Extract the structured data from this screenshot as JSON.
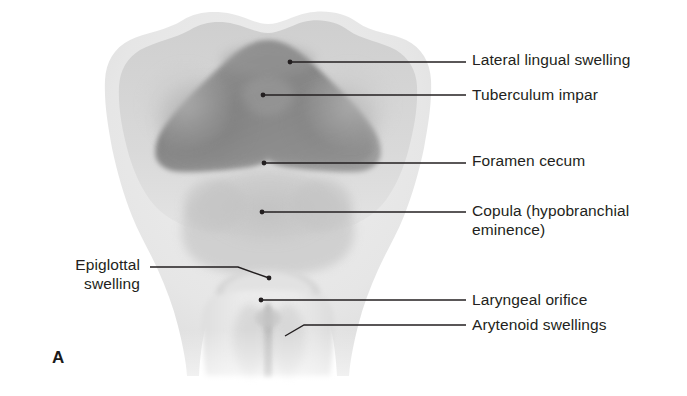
{
  "figure": {
    "panel_letter": "A",
    "panel_letter_x": 52,
    "panel_letter_y": 348,
    "line_color": "#231f20",
    "text_color": "#231f20",
    "background_color": "#ffffff"
  },
  "illustration": {
    "name": "embryonic-tongue-development",
    "description": "Grayscale anatomical drawing of the developing floor of the pharynx and tongue",
    "tone_outer": "#e9e9e9",
    "tone_mid": "#d2d2d2",
    "tone_light_mass": "#c9c9c9",
    "tone_dark_mass": "#8d8d8d",
    "tone_darker_mass": "#7c7c7c",
    "tone_shadow": "#b4b4b4"
  },
  "labels": [
    {
      "id": "lateral-lingual-swelling",
      "text": "Lateral lingual swelling",
      "side": "right",
      "text_x": 472,
      "text_y": 50,
      "anchor_x": 290,
      "anchor_y": 62,
      "elbow_x": 466,
      "elbow_y": 62,
      "has_dot": true
    },
    {
      "id": "tuberculum-impar",
      "text": "Tuberculum impar",
      "side": "right",
      "text_x": 472,
      "text_y": 85,
      "anchor_x": 263,
      "anchor_y": 95,
      "elbow_x": 466,
      "elbow_y": 95,
      "has_dot": true
    },
    {
      "id": "foramen-cecum",
      "text": "Foramen cecum",
      "side": "right",
      "text_x": 472,
      "text_y": 149,
      "anchor_x": 264,
      "anchor_y": 163,
      "elbow_x": 466,
      "elbow_y": 163,
      "has_dot": true
    },
    {
      "id": "copula-hypobranchial-eminence",
      "text": "Copula (hypobranchial\neminence)",
      "side": "right",
      "text_x": 472,
      "text_y": 201,
      "anchor_x": 262,
      "anchor_y": 212,
      "elbow_x": 466,
      "elbow_y": 212,
      "has_dot": true
    },
    {
      "id": "laryngeal-orifice",
      "text": "Laryngeal orifice",
      "side": "right",
      "text_x": 472,
      "text_y": 289,
      "anchor_x": 261,
      "anchor_y": 300,
      "elbow_x": 466,
      "elbow_y": 300,
      "has_dot": true
    },
    {
      "id": "arytenoid-swellings",
      "text": "Arytenoid swellings",
      "side": "right",
      "text_x": 472,
      "text_y": 314,
      "anchor_x": 285,
      "anchor_y": 336,
      "elbow_x": 466,
      "elbow_y": 325,
      "hook_x": 304,
      "hook_y": 325,
      "has_dot": false
    },
    {
      "id": "epiglottal-swelling",
      "text": "Epiglottal\nswelling",
      "side": "left",
      "text_right": 140,
      "text_y": 255,
      "anchor_x": 269,
      "anchor_y": 278,
      "elbow_x": 150,
      "elbow_y": 267,
      "hook_x": 238,
      "hook_y": 267,
      "has_dot": true
    }
  ]
}
